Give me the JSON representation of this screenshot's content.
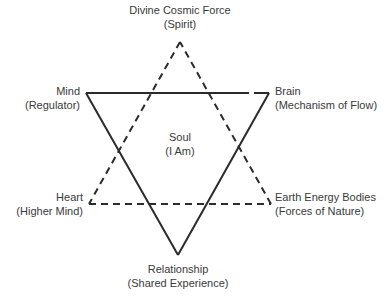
{
  "diagram": {
    "type": "hexagram",
    "colors": {
      "line": "#2b2b2b",
      "text": "#3a3a3a"
    },
    "solid_triangle": {
      "style": "solid",
      "vertices": [
        {
          "id": "mind",
          "x": 86,
          "y": 93
        },
        {
          "id": "brain",
          "x": 269,
          "y": 93
        },
        {
          "id": "relationship",
          "x": 178,
          "y": 255
        }
      ]
    },
    "dashed_triangle": {
      "style": "dashed",
      "vertices": [
        {
          "id": "divine",
          "x": 180,
          "y": 42
        },
        {
          "id": "heart",
          "x": 89,
          "y": 204
        },
        {
          "id": "earth",
          "x": 271,
          "y": 204
        }
      ]
    },
    "nodes": {
      "divine": {
        "title": "Divine Cosmic Force",
        "subtitle": "(Spirit)"
      },
      "mind": {
        "title": "Mind",
        "subtitle": "(Regulator)"
      },
      "brain": {
        "title": "Brain",
        "subtitle": "(Mechanism of Flow)"
      },
      "soul": {
        "title": "Soul",
        "subtitle": "(I Am)"
      },
      "heart": {
        "title": "Heart",
        "subtitle": "(Higher Mind)"
      },
      "earth": {
        "title": "Earth Energy Bodies",
        "subtitle": "(Forces of Nature)"
      },
      "relationship": {
        "title": "Relationship",
        "subtitle": "(Shared Experience)"
      }
    },
    "edges": [
      {
        "from": "mind",
        "to": "brain",
        "style": "solid"
      },
      {
        "from": "brain",
        "to": "relationship",
        "style": "solid"
      },
      {
        "from": "relationship",
        "to": "mind",
        "style": "solid"
      },
      {
        "from": "divine",
        "to": "heart",
        "style": "dashed"
      },
      {
        "from": "heart",
        "to": "earth",
        "style": "dashed"
      },
      {
        "from": "earth",
        "to": "divine",
        "style": "dashed"
      }
    ]
  },
  "caption": "Figure 1.1  ..."
}
